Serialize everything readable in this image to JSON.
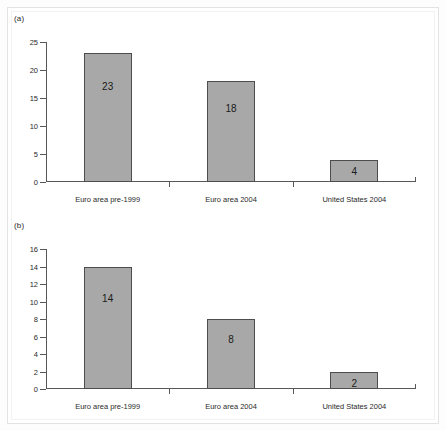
{
  "figure": {
    "background_color": "#ffffff",
    "bar_fill_color": "#a8a8a8",
    "bar_border_color": "#4d4d4d",
    "axis_color": "#58585a",
    "text_color": "#231f20"
  },
  "panels": [
    {
      "id": "a",
      "label": "(a)"
    },
    {
      "id": "b",
      "label": "(b)"
    }
  ],
  "chart_data": [
    {
      "type": "bar",
      "panel": "(a)",
      "title": "",
      "xlabel": "",
      "ylabel": "",
      "categories": [
        "Euro area pre-1999",
        "Euro area 2004",
        "United States 2004"
      ],
      "values": [
        23,
        18,
        4
      ],
      "data_labels": [
        "23",
        "18",
        "4"
      ],
      "ylim": [
        0,
        25
      ],
      "yticks": [
        0,
        5,
        10,
        15,
        20,
        25
      ],
      "ytick_labels": [
        "0",
        "5",
        "10",
        "15",
        "20",
        "25"
      ],
      "grid": false,
      "legend": false
    },
    {
      "type": "bar",
      "panel": "(b)",
      "title": "",
      "xlabel": "",
      "ylabel": "",
      "categories": [
        "Euro area pre-1999",
        "Euro area 2004",
        "United States 2004"
      ],
      "values": [
        14,
        8,
        2
      ],
      "data_labels": [
        "14",
        "8",
        "2"
      ],
      "ylim": [
        0,
        16
      ],
      "yticks": [
        0,
        2,
        4,
        6,
        8,
        10,
        12,
        14,
        16
      ],
      "ytick_labels": [
        "0",
        "2",
        "4",
        "6",
        "8",
        "10",
        "12",
        "14",
        "16"
      ],
      "grid": false,
      "legend": false
    }
  ]
}
